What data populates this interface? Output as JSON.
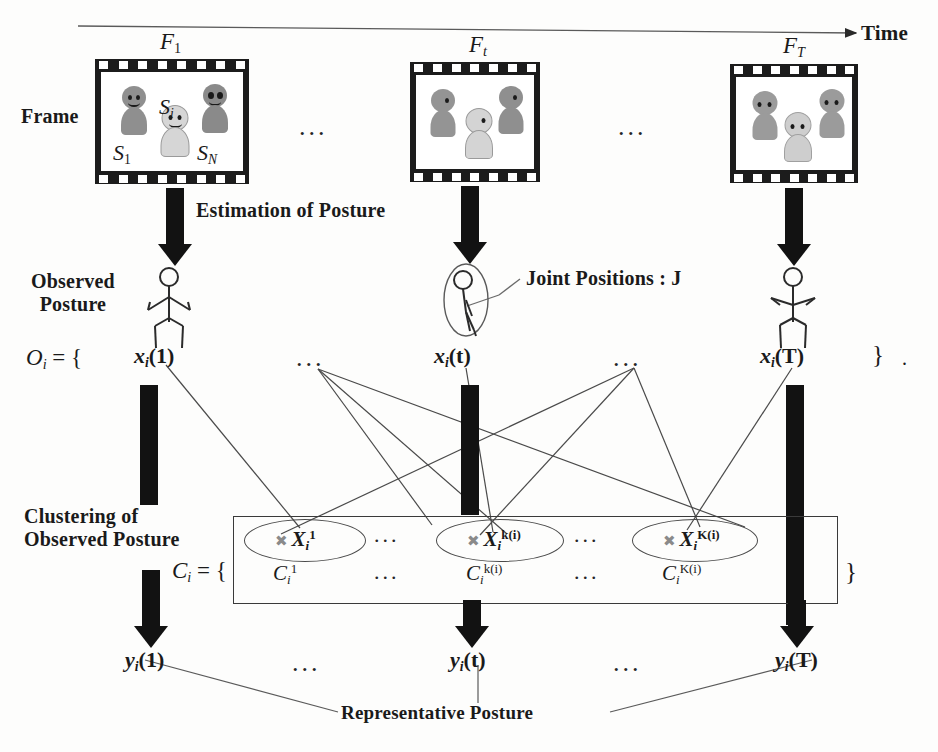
{
  "diagram": {
    "title_axis": "Time",
    "row_labels": {
      "frame": "Frame",
      "observed_posture": "Observed\nPosture",
      "observed_posture_l1": "Observed",
      "observed_posture_l2": "Posture",
      "clustering_l1": "Clustering of",
      "clustering_l2": "Observed Posture"
    },
    "process_labels": {
      "estimation": "Estimation of Posture",
      "joint_positions": "Joint Positions : J",
      "representative": "Representative Posture"
    },
    "frames": [
      {
        "name": "frame-1",
        "label_base": "F",
        "label_sub": "1",
        "subjects": [
          "S",
          "S",
          "S"
        ],
        "subject_labels": [
          {
            "base": "S",
            "sub": "1"
          },
          {
            "base": "S",
            "sub": "i"
          },
          {
            "base": "S",
            "sub": "N"
          }
        ]
      },
      {
        "name": "frame-t",
        "label_base": "F",
        "label_sub": "t",
        "subjects": [
          "S",
          "S",
          "S"
        ],
        "subject_labels": []
      },
      {
        "name": "frame-T",
        "label_base": "F",
        "label_sub": "T",
        "subjects": [
          "S",
          "S",
          "S"
        ],
        "subject_labels": []
      }
    ],
    "observed_set": {
      "prefix_base": "O",
      "prefix_sub": "i",
      "prefix_eq": " = {",
      "suffix": "}",
      "trailing_period": ".",
      "items": [
        {
          "base": "x",
          "sub": "i",
          "arg": "(1)"
        },
        {
          "base": "x",
          "sub": "i",
          "arg": "(t)"
        },
        {
          "base": "x",
          "sub": "i",
          "arg": "(T)"
        }
      ]
    },
    "cluster_set": {
      "prefix_base": "C",
      "prefix_sub": "i",
      "prefix_eq": " = {",
      "suffix": "}",
      "clusters": [
        {
          "centroid_base": "X",
          "centroid_sub": "i",
          "centroid_sup": "1",
          "label_base": "C",
          "label_sub": "i",
          "label_sup": "1",
          "marker": "x-marker"
        },
        {
          "centroid_base": "X",
          "centroid_sub": "i",
          "centroid_sup": "k(i)",
          "label_base": "C",
          "label_sub": "i",
          "label_sup": "k(i)",
          "marker": "x-marker"
        },
        {
          "centroid_base": "X",
          "centroid_sub": "i",
          "centroid_sup": "K(i)",
          "label_base": "C",
          "label_sub": "i",
          "label_sup": "K(i)",
          "marker": "x-marker"
        }
      ]
    },
    "representative_set": {
      "items": [
        {
          "base": "y",
          "sub": "i",
          "arg": "(1)"
        },
        {
          "base": "y",
          "sub": "i",
          "arg": "(t)"
        },
        {
          "base": "y",
          "sub": "i",
          "arg": "(T)"
        }
      ]
    },
    "ellipses": [
      "...",
      "...",
      "...",
      "...",
      "...",
      "...",
      "...",
      "...",
      "...",
      "..."
    ],
    "colors": {
      "ink": "#1a1a1a",
      "arrow_fill": "#121212",
      "line": "#4a4a4a",
      "person_dark": "#8c8c8c",
      "person_mid": "#a3a3a3",
      "person_light": "#cfcfcf",
      "background": "#fdfdfc"
    }
  }
}
